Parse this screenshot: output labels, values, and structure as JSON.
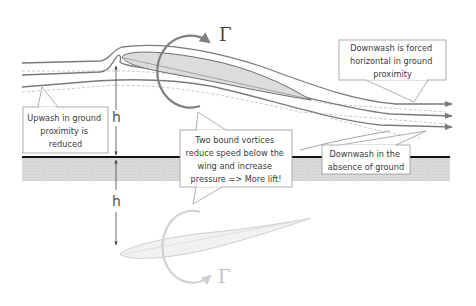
{
  "diagram": {
    "symbols": {
      "circulation": "Γ",
      "circulation_mirror": "Γ",
      "height": "h",
      "height_mirror": "h"
    },
    "callouts": {
      "upwash": {
        "lines": [
          "Upwash in ground",
          "proximity is",
          "reduced"
        ]
      },
      "bound_vortices": {
        "lines": [
          "Two bound vortices",
          "reduce speed below the",
          "wing and increase",
          "pressure => More lift!"
        ]
      },
      "downwash_forced": {
        "lines": [
          "Downwash is forced",
          "horizontal in ground",
          "proximity"
        ]
      },
      "downwash_absence": {
        "lines": [
          "Downwash in the",
          "absence of ground"
        ]
      }
    },
    "colors": {
      "streamline": "#7a7a7a",
      "streamline_free": "#b8b8b8",
      "wing_fill": "#d9d9d9",
      "ground_line": "#111111",
      "ground_fill": "#d7d7d7",
      "vortex": "#808080",
      "mirror": "#cfcfcf",
      "callout_border": "#9a9a9a"
    }
  }
}
